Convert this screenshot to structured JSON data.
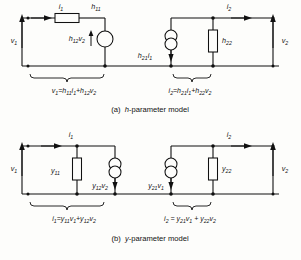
{
  "figure": {
    "background_color": "#fdfdfb",
    "ink_color": "#111111"
  },
  "panels": [
    {
      "id": "h-parameter",
      "caption_prefix": "(a)",
      "caption_italic": "h",
      "caption_rest": "-parameter model",
      "caption_full": "(a)  h-parameter model",
      "ports": {
        "input_voltage": "v1",
        "output_voltage": "v2",
        "input_current": "i1",
        "output_current": "i2"
      },
      "labels": {
        "i1": "i1",
        "i2": "i2",
        "v1": "v1",
        "v2": "v2",
        "series_element": "h11",
        "dependent_voltage_source": "h12v2",
        "dependent_current_source": "h21i1",
        "shunt_element": "h22"
      },
      "equations": {
        "left": "v1 = h11i1 + h12v2",
        "right": "i2 = h21i1 + h22v2"
      }
    },
    {
      "id": "y-parameter",
      "caption_prefix": "(b)",
      "caption_italic": "y",
      "caption_rest": "-parameter model",
      "caption_full": "(b)  y-parameter model",
      "ports": {
        "input_voltage": "v1",
        "output_voltage": "v2",
        "input_current": "i1",
        "output_current": "i2"
      },
      "labels": {
        "i1": "i1",
        "i2": "i2",
        "v1": "v1",
        "v2": "v2",
        "input_shunt_element": "y11",
        "input_dependent_current_source": "y12v2",
        "output_dependent_current_source": "y21v1",
        "output_shunt_element": "y22"
      },
      "equations": {
        "left": "i1 = y11v1 + y12v2",
        "right": "i2 = y21v1 + y22v2"
      }
    }
  ],
  "symbols": {
    "resistor": "rectangle-box",
    "voltage_source": "single-circle",
    "current_source": "double-circle",
    "node": "filled-dot",
    "arrow": "solid-triangle",
    "brace": "curly-brace-underline"
  }
}
